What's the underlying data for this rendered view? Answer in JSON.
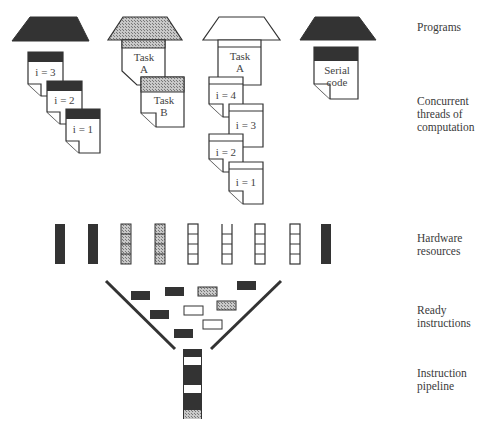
{
  "labels": {
    "programs": "Programs",
    "threads": "Concurrent\nthreads of\ncomputation",
    "hardware": "Hardware\nresources",
    "ready": "Ready\ninstructions",
    "pipeline": "Instruction\npipeline"
  },
  "programs": [
    {
      "fill": "dark",
      "threads": [
        "i = 3",
        "i = 2",
        "i = 1"
      ]
    },
    {
      "fill": "hatched",
      "threads": [
        "Task\nA",
        "Task\nB"
      ]
    },
    {
      "fill": "white",
      "threads": [
        "Task\nA",
        "i = 4",
        "i = 3",
        "i = 2",
        "i = 1"
      ]
    },
    {
      "fill": "dark",
      "threads": [
        "Serial\ncode"
      ]
    }
  ],
  "thread_text": {
    "p1": [
      "i = 3",
      "i = 2",
      "i = 1"
    ],
    "p2": [
      "Task",
      "A",
      "Task",
      "B"
    ],
    "p3": [
      "Task",
      "A",
      "i = 4",
      "i = 3",
      "i = 2",
      "i = 1"
    ],
    "p4": [
      "Serial",
      "code"
    ]
  },
  "hardware_resources": [
    "dark",
    "dark",
    "hatched",
    "hatched",
    "white",
    "white-open",
    "white",
    "white",
    "dark"
  ],
  "ready_instructions": [
    "dark",
    "dark",
    "hatched",
    "dark",
    "dark",
    "white",
    "hatched",
    "white",
    "dark"
  ],
  "pipeline_stages": [
    "dark",
    "white",
    "dark",
    "dark",
    "white",
    "dark",
    "hatched"
  ],
  "colors": {
    "dark": "#333333",
    "hatch": "#9a9a9a",
    "line": "#333333",
    "white": "#ffffff"
  }
}
